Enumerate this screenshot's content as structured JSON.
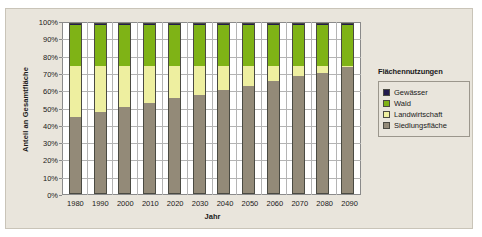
{
  "chart_data": {
    "type": "bar",
    "subtype": "stacked-percent",
    "title": "",
    "xlabel": "Jahr",
    "ylabel": "Anteil an Gesamtfläche",
    "categories": [
      "1980",
      "1990",
      "2000",
      "2010",
      "2020",
      "2030",
      "2040",
      "2050",
      "2060",
      "2070",
      "2080",
      "2090"
    ],
    "ylim": [
      0,
      100
    ],
    "y_ticks": [
      "0%",
      "10%",
      "20%",
      "30%",
      "40%",
      "50%",
      "60%",
      "70%",
      "80%",
      "90%",
      "100%"
    ],
    "grid": true,
    "legend_position": "right",
    "legend_title": "Flächennutzungen",
    "series": [
      {
        "name": "Siedlungsfläche",
        "color": "#938a78",
        "values": [
          45,
          48,
          51,
          53,
          56,
          58,
          61,
          63,
          66,
          69,
          71,
          74
        ]
      },
      {
        "name": "Landwirtschaft",
        "color": "#eeefa0",
        "values": [
          30,
          27,
          24,
          22,
          19,
          17,
          14,
          12,
          9,
          6,
          4,
          1
        ]
      },
      {
        "name": "Wald",
        "color": "#7fb316",
        "values": [
          24,
          24,
          24,
          24,
          24,
          24,
          24,
          24,
          24,
          24,
          24,
          24
        ]
      },
      {
        "name": "Gewässer",
        "color": "#221b4e",
        "values": [
          1,
          1,
          1,
          1,
          1,
          1,
          1,
          1,
          1,
          1,
          1,
          1
        ]
      }
    ],
    "stack_order_bottom_to_top": [
      "Siedlungsfläche",
      "Landwirtschaft",
      "Wald",
      "Gewässer"
    ],
    "legend_order_top_to_bottom": [
      "Gewässer",
      "Wald",
      "Landwirtschaft",
      "Siedlungsfläche"
    ]
  },
  "colors": {
    "plot_background": "#ffffff",
    "card_background": "#e9e5dc",
    "gridline": "#b4b4b4",
    "axis": "#8a8a8a",
    "text": "#1a1a1a"
  }
}
